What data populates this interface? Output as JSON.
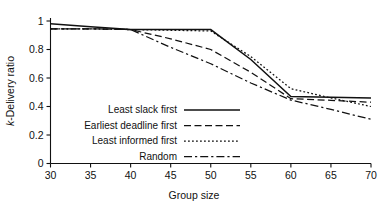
{
  "chart_data": {
    "type": "line",
    "title": "",
    "xlabel": "Group size",
    "ylabel": "k-Delivery ratio",
    "ylabel_prefix_italic": "k",
    "ylabel_rest": "-Delivery ratio",
    "xlim": [
      30,
      70
    ],
    "ylim": [
      0,
      1
    ],
    "xticks": [
      30,
      35,
      40,
      45,
      50,
      55,
      60,
      65,
      70
    ],
    "xtick_labels": [
      "30",
      "35",
      "40",
      "45",
      "50",
      "55",
      "60",
      "65",
      "70"
    ],
    "yticks": [
      0,
      0.2,
      0.4,
      0.6,
      0.8,
      1
    ],
    "ytick_labels": [
      "0",
      "0.2",
      "0.4",
      "0.6",
      "0.8",
      "1"
    ],
    "grid": false,
    "legend_position": "center-left-inside",
    "x": [
      30,
      35,
      40,
      45,
      50,
      55,
      60,
      65,
      70
    ],
    "series": [
      {
        "name": "Least slack first",
        "style": "solid",
        "values": [
          0.98,
          0.96,
          0.94,
          0.94,
          0.94,
          0.73,
          0.47,
          0.465,
          0.46
        ]
      },
      {
        "name": "Earliest deadline first",
        "style": "dashed",
        "values": [
          0.945,
          0.945,
          0.94,
          0.875,
          0.8,
          0.64,
          0.455,
          0.443,
          0.43
        ]
      },
      {
        "name": "Least informed first",
        "style": "dotted",
        "values": [
          0.945,
          0.945,
          0.94,
          0.935,
          0.93,
          0.75,
          0.525,
          0.46,
          0.4
        ]
      },
      {
        "name": "Random",
        "style": "dashdot",
        "values": [
          0.945,
          0.945,
          0.94,
          0.815,
          0.7,
          0.565,
          0.445,
          0.38,
          0.31
        ]
      }
    ]
  },
  "legend": {
    "items": [
      {
        "label": "Least slack first",
        "style": "solid"
      },
      {
        "label": "Earliest deadline first",
        "style": "dashed"
      },
      {
        "label": "Least informed first",
        "style": "dotted"
      },
      {
        "label": "Random",
        "style": "dashdot"
      }
    ]
  }
}
